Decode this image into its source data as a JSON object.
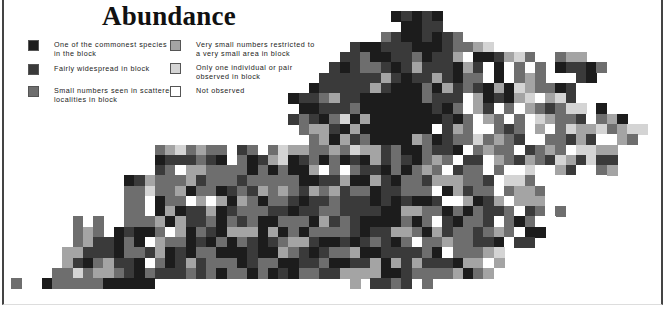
{
  "title": "Abundance",
  "legend": [
    {
      "code": "1",
      "label": "One of the commonest species\nin the block",
      "color": "#1c1c1c"
    },
    {
      "code": "2",
      "label": "Fairly widespread in block",
      "color": "#3a3a3a"
    },
    {
      "code": "3",
      "label": "Small numbers seen in scattered\nlocalities in block",
      "color": "#6e6e6e"
    },
    {
      "code": "4",
      "label": "Very small numbers restricted to\na very small area in block",
      "color": "#a4a4a4"
    },
    {
      "code": "5",
      "label": "Only one individual or pair\nobserved in block",
      "color": "#d4d4d4"
    },
    {
      "code": "0",
      "label": "Not observed",
      "color": "#ffffff"
    }
  ],
  "map": {
    "region": "Kentucky",
    "grid_origin": [
      11,
      11
    ],
    "cell_size": 10.27,
    "rows": [
      ".....................................12121.........................",
      "......................................1122.........................",
      "....................................32112123........................",
      ".................................21122211123345.....................",
      "................................2231122312240112453..344............",
      "...............................212332124222142010303.12213.........",
      "..............................2222224212242133010343...21...........",
      ".............................12222242111314232141543312..............",
      "...........................1223422111111322204121450452.............",
      "............................1122231111111213042030432355.1..........",
      "...........................232135141111111213043030543320341.......",
      "............................3442141111111024300323040354453455.....",
      ".............................34142311114312335343200332420043......",
      "..............3453433.23.3544334354423113221034330234305544........",
      "..............122232103124512313121423213430220432432542522.......",
      "..............230443333131311403032213134302330300500420034........",
      "...........12433342333233333112241142133244433205530000000.........",
      "...........3353341331232434324342331223330142330344300000..........",
      "...........330133040414313321223222121211200412404440............",
      "...........3301412241233322122332222114433131322302303............",
      "......3.3..333414223132311333142321111313021332031300.............",
      "......343.121130413214441413133332122443142332343011..............",
      "......342213104331213132123442112123213033433221022................",
      ".....4422213324121331112114321233411222231033345....................",
      ".....4213422103124233312331122311224142422214404.....................",
      "....3353443213222323133131213322444411233334134.....................",
      "3..13333311111...................4.2232.3............................"
    ]
  }
}
